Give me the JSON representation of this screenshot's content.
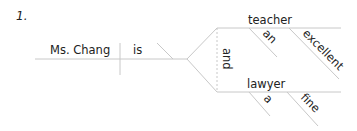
{
  "problem_number": "1.",
  "diagram": {
    "subject": "Ms. Chang",
    "verb": "is",
    "conjunction": "and",
    "complements": [
      {
        "word": "teacher",
        "modifiers": [
          "an",
          "excellent"
        ]
      },
      {
        "word": "lawyer",
        "modifiers": [
          "a",
          "fine"
        ]
      }
    ]
  },
  "colors": {
    "line": "#c8c8c8",
    "text": "#222222"
  }
}
